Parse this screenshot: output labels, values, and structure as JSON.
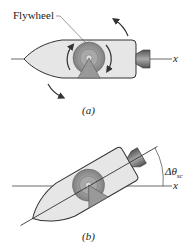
{
  "figure_a": {
    "flywheel_label": "Flywheel",
    "axis_label": "x",
    "caption": "(a)"
  },
  "figure_b": {
    "angle_label_delta": "Δθ",
    "angle_label_sub": "sc",
    "axis_label": "x",
    "caption": "(b)"
  },
  "colors": {
    "body_fill": "#e6e6e6",
    "body_stroke": "#333333",
    "flywheel_outer": "#8a8a8a",
    "flywheel_inner": "#a8a8a8",
    "nozzle": "#777777",
    "arrow": "#333333"
  }
}
